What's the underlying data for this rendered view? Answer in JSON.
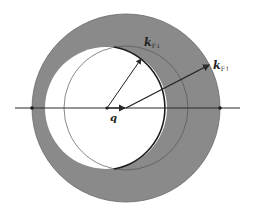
{
  "diagram": {
    "labels": {
      "k_down": {
        "base": "k",
        "sub": "F↓"
      },
      "k_up": {
        "base": "k",
        "sub": "F↑"
      },
      "q": "q"
    },
    "colors": {
      "fill_shaded": "#8a8a8a",
      "line": "#2a2a2a",
      "background": "#ffffff"
    },
    "geometry": {
      "outer_circle": {
        "cx": 126,
        "cy": 108,
        "r": 94
      },
      "shifted_circle": {
        "cx": 106,
        "cy": 108,
        "r": 61
      },
      "minority_circle": {
        "cx": 126,
        "cy": 108,
        "r": 62
      },
      "axis_y": 108
    }
  }
}
